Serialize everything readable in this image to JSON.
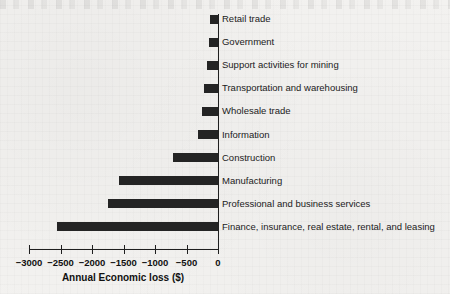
{
  "chart_data": {
    "type": "bar",
    "orientation": "horizontal",
    "title": "",
    "xlabel": "Annual Economic loss ($)",
    "ylabel": "",
    "xlim": [
      -3000,
      0
    ],
    "grid": false,
    "legend": null,
    "bar_color": "#242424",
    "xticks": [
      "−3000",
      "−2500",
      "−2000",
      "−1500",
      "−1000",
      "−500",
      "0"
    ],
    "xtick_values": [
      -3000,
      -2500,
      -2000,
      -1500,
      -1000,
      -500,
      0
    ],
    "categories": [
      "Retail trade",
      "Government",
      "Support activities for mining",
      "Transportation and warehousing",
      "Wholesale trade",
      "Information",
      "Construction",
      "Manufacturing",
      "Professional and business services",
      "Finance, insurance, real estate, rental, and leasing"
    ],
    "values": [
      -120,
      -140,
      -180,
      -230,
      -260,
      -320,
      -710,
      -1570,
      -1745,
      -2560
    ]
  },
  "axis": {
    "x_axis_title": "Annual Economic loss ($)"
  }
}
